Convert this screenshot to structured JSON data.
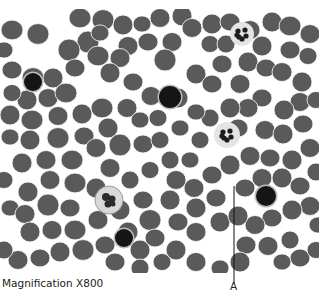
{
  "figure": {
    "caption": "Magnification X800",
    "pointer_label": "A",
    "pointer": {
      "x": 234,
      "y1": 186,
      "y2": 283
    },
    "field": {
      "x": 0,
      "y": 9,
      "w": 319,
      "h": 264,
      "background": "#ffffff"
    },
    "colors": {
      "rbc": "#5a5a5a",
      "rbc_edge": "#4a4a4a",
      "lymphocyte": "#151515",
      "neutrophil_halo": "#e4e4e4",
      "neutrophil_nucleus": "#1c1c1c",
      "monocyte_halo": "#d8d8d8",
      "monocyte_nucleus": "#2b2b2b"
    },
    "red_cells": [
      [
        80,
        18,
        11
      ],
      [
        103,
        20,
        11
      ],
      [
        123,
        25,
        10
      ],
      [
        12,
        30,
        11
      ],
      [
        38,
        34,
        11
      ],
      [
        88,
        42,
        11
      ],
      [
        100,
        33,
        9
      ],
      [
        128,
        46,
        10
      ],
      [
        69,
        50,
        11
      ],
      [
        98,
        56,
        11
      ],
      [
        120,
        58,
        10
      ],
      [
        110,
        73,
        10
      ],
      [
        142,
        24,
        9
      ],
      [
        160,
        18,
        10
      ],
      [
        182,
        16,
        10
      ],
      [
        148,
        42,
        10
      ],
      [
        172,
        42,
        10
      ],
      [
        165,
        60,
        11
      ],
      [
        133,
        82,
        10
      ],
      [
        151,
        96,
        10
      ],
      [
        178,
        98,
        10
      ],
      [
        12,
        70,
        10
      ],
      [
        33,
        78,
        11
      ],
      [
        53,
        78,
        10
      ],
      [
        75,
        68,
        10
      ],
      [
        48,
        98,
        10
      ],
      [
        27,
        100,
        10
      ],
      [
        66,
        93,
        11
      ],
      [
        12,
        93,
        9
      ],
      [
        10,
        115,
        10
      ],
      [
        32,
        120,
        11
      ],
      [
        58,
        116,
        10
      ],
      [
        82,
        114,
        10
      ],
      [
        102,
        108,
        11
      ],
      [
        127,
        108,
        10
      ],
      [
        108,
        128,
        10
      ],
      [
        84,
        136,
        10
      ],
      [
        58,
        138,
        11
      ],
      [
        30,
        140,
        10
      ],
      [
        10,
        137,
        9
      ],
      [
        46,
        160,
        10
      ],
      [
        22,
        163,
        10
      ],
      [
        72,
        160,
        11
      ],
      [
        96,
        148,
        10
      ],
      [
        120,
        145,
        11
      ],
      [
        143,
        144,
        10
      ],
      [
        110,
        168,
        10
      ],
      [
        96,
        188,
        10
      ],
      [
        75,
        183,
        11
      ],
      [
        50,
        180,
        10
      ],
      [
        28,
        192,
        10
      ],
      [
        10,
        208,
        9
      ],
      [
        25,
        214,
        10
      ],
      [
        48,
        205,
        11
      ],
      [
        70,
        208,
        10
      ],
      [
        52,
        230,
        10
      ],
      [
        30,
        232,
        10
      ],
      [
        75,
        230,
        11
      ],
      [
        98,
        220,
        10
      ],
      [
        120,
        210,
        10
      ],
      [
        143,
        200,
        10
      ],
      [
        150,
        220,
        11
      ],
      [
        128,
        232,
        10
      ],
      [
        105,
        245,
        10
      ],
      [
        83,
        250,
        11
      ],
      [
        60,
        252,
        10
      ],
      [
        40,
        258,
        10
      ],
      [
        18,
        260,
        10
      ],
      [
        140,
        250,
        10
      ],
      [
        155,
        238,
        10
      ],
      [
        162,
        262,
        9
      ],
      [
        140,
        268,
        9
      ],
      [
        115,
        262,
        10
      ],
      [
        192,
        28,
        10
      ],
      [
        212,
        24,
        10
      ],
      [
        230,
        22,
        10
      ],
      [
        250,
        30,
        10
      ],
      [
        272,
        22,
        10
      ],
      [
        290,
        26,
        11
      ],
      [
        310,
        34,
        10
      ],
      [
        262,
        46,
        10
      ],
      [
        290,
        50,
        10
      ],
      [
        308,
        56,
        9
      ],
      [
        248,
        62,
        10
      ],
      [
        266,
        68,
        10
      ],
      [
        282,
        72,
        10
      ],
      [
        302,
        82,
        10
      ],
      [
        222,
        64,
        10
      ],
      [
        240,
        84,
        10
      ],
      [
        196,
        74,
        10
      ],
      [
        212,
        84,
        10
      ],
      [
        300,
        102,
        10
      ],
      [
        284,
        110,
        10
      ],
      [
        262,
        98,
        10
      ],
      [
        248,
        108,
        10
      ],
      [
        230,
        108,
        10
      ],
      [
        238,
        128,
        10
      ],
      [
        265,
        130,
        10
      ],
      [
        283,
        134,
        10
      ],
      [
        303,
        124,
        10
      ],
      [
        310,
        148,
        10
      ],
      [
        292,
        160,
        10
      ],
      [
        270,
        158,
        10
      ],
      [
        250,
        156,
        10
      ],
      [
        230,
        165,
        10
      ],
      [
        212,
        175,
        10
      ],
      [
        194,
        188,
        10
      ],
      [
        196,
        208,
        10
      ],
      [
        216,
        198,
        10
      ],
      [
        176,
        180,
        10
      ],
      [
        170,
        200,
        10
      ],
      [
        178,
        222,
        10
      ],
      [
        196,
        232,
        10
      ],
      [
        220,
        222,
        10
      ],
      [
        245,
        188,
        10
      ],
      [
        262,
        178,
        10
      ],
      [
        282,
        178,
        10
      ],
      [
        300,
        186,
        10
      ],
      [
        310,
        206,
        10
      ],
      [
        292,
        210,
        10
      ],
      [
        272,
        218,
        10
      ],
      [
        255,
        225,
        10
      ],
      [
        238,
        216,
        10
      ],
      [
        246,
        245,
        10
      ],
      [
        268,
        246,
        10
      ],
      [
        290,
        240,
        9
      ],
      [
        300,
        258,
        10
      ],
      [
        316,
        250,
        9
      ],
      [
        240,
        262,
        10
      ],
      [
        220,
        268,
        9
      ],
      [
        196,
        262,
        10
      ],
      [
        176,
        250,
        10
      ],
      [
        282,
        262,
        9
      ],
      [
        316,
        100,
        9
      ],
      [
        316,
        172,
        9
      ],
      [
        4,
        50,
        9
      ],
      [
        4,
        180,
        9
      ],
      [
        4,
        250,
        9
      ],
      [
        318,
        225,
        9
      ],
      [
        210,
        44,
        9
      ],
      [
        226,
        44,
        9
      ],
      [
        180,
        128,
        9
      ],
      [
        200,
        140,
        9
      ],
      [
        210,
        118,
        9
      ],
      [
        196,
        112,
        9
      ],
      [
        158,
        118,
        9
      ],
      [
        170,
        160,
        9
      ],
      [
        190,
        160,
        9
      ],
      [
        150,
        170,
        9
      ],
      [
        130,
        180,
        9
      ],
      [
        140,
        120,
        9
      ],
      [
        160,
        140,
        9
      ]
    ],
    "white_cells": [
      {
        "type": "lymphocyte",
        "cx": 33,
        "cy": 82,
        "r": 9
      },
      {
        "type": "lymphocyte",
        "cx": 170,
        "cy": 97,
        "r": 11
      },
      {
        "type": "lymphocyte",
        "cx": 124,
        "cy": 238,
        "r": 9
      },
      {
        "type": "lymphocyte",
        "cx": 266,
        "cy": 196,
        "r": 10
      },
      {
        "type": "neutrophil",
        "cx": 242,
        "cy": 34,
        "r": 12
      },
      {
        "type": "neutrophil",
        "cx": 227,
        "cy": 135,
        "r": 13
      },
      {
        "type": "monocyte",
        "cx": 109,
        "cy": 200,
        "r": 14
      }
    ]
  }
}
